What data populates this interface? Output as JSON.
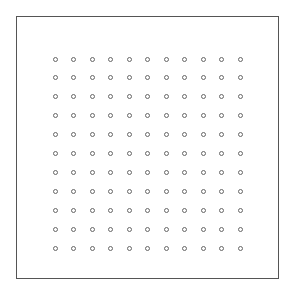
{
  "chart_data": {
    "type": "scatter",
    "title": "",
    "xlabel": "",
    "ylabel": "",
    "grid": false,
    "legend": null,
    "marker": "open-circle",
    "marker_color": "#666666",
    "frame_color": "#555555",
    "rows": 11,
    "cols": 11,
    "x": [
      0,
      1,
      2,
      3,
      4,
      5,
      6,
      7,
      8,
      9,
      10
    ],
    "y": [
      0,
      1,
      2,
      3,
      4,
      5,
      6,
      7,
      8,
      9,
      10
    ]
  }
}
